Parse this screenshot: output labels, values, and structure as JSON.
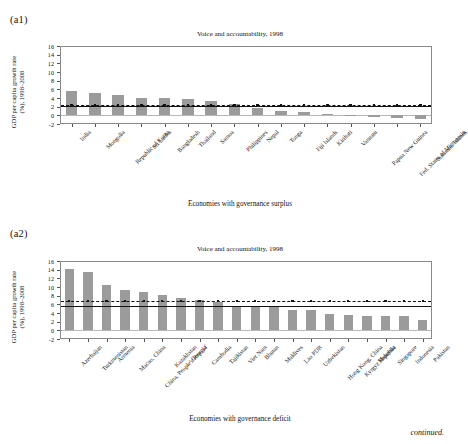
{
  "panels": {
    "a1": {
      "tag": "(a1)",
      "title": "Voice and accountability, 1998",
      "ylabel_line1": "GDP per capita growth rate",
      "ylabel_line2": "(%), 1998–2008",
      "xlabel": "Economies with governance surplus"
    },
    "a2": {
      "tag": "(a2)",
      "title": "Voice and accountability, 1998",
      "ylabel_line1": "GDP per capita growth rate",
      "ylabel_line2": "(%), 1998–2008",
      "xlabel": "Economies with governance deficit"
    }
  },
  "footer": {
    "continued": "continued."
  },
  "chart_data": [
    {
      "id": "a1",
      "type": "bar",
      "title": "Voice and accountability, 1998",
      "xlabel": "Economies with governance surplus",
      "ylabel": "GDP per capita growth rate (%), 1998–2008",
      "ylim": [
        -2,
        16
      ],
      "yticks": [
        -2,
        0,
        2,
        4,
        6,
        8,
        10,
        12,
        14,
        16
      ],
      "ytick_labels": [
        "-2",
        "0",
        "2",
        "4",
        "6",
        "8",
        "10",
        "12",
        "14",
        "16"
      ],
      "grid": false,
      "legend": "none",
      "bar_color": "#9b9b9b",
      "categories": [
        "India",
        "Mongolia",
        "Republic of Korea",
        "Sri Lanka",
        "Bangladesh",
        "Thailand",
        "Samoa",
        "Philippines",
        "Nepal",
        "Tonga",
        "Fiji Islands",
        "Kiribati",
        "Vanuatu",
        "Papua New Guinea",
        "Fed. States of Micronesia",
        "Solomon Islands"
      ],
      "values": [
        5.6,
        5.1,
        4.7,
        4.1,
        4.0,
        3.8,
        3.2,
        2.6,
        1.7,
        1.1,
        0.8,
        0.3,
        0.05,
        -0.3,
        -0.7,
        -0.8
      ],
      "reference_lines": [
        {
          "name": "mean-dashed",
          "value": 2.3,
          "style": "dashed",
          "markers": true,
          "color": "#111111"
        },
        {
          "name": "mean-solid",
          "value": 2.1,
          "style": "solid",
          "markers": false,
          "color": "#111111"
        }
      ]
    },
    {
      "id": "a2",
      "type": "bar",
      "title": "Voice and accountability, 1998",
      "xlabel": "Economies with governance deficit",
      "ylabel": "GDP per capita growth rate (%), 1998–2008",
      "ylim": [
        -2,
        16
      ],
      "yticks": [
        -2,
        0,
        2,
        4,
        6,
        8,
        10,
        12,
        14,
        16
      ],
      "ytick_labels": [
        "-2",
        "0",
        "2",
        "4",
        "6",
        "8",
        "10",
        "12",
        "14",
        "16"
      ],
      "grid": false,
      "legend": "none",
      "bar_color": "#9b9b9b",
      "categories": [
        "Azerbaijan",
        "Turkmenistan",
        "Armenia",
        "Macao, China",
        "China, People's Rep. of",
        "Kazakhstan",
        "Georgia",
        "Cambodia",
        "Tajikistan",
        "Viet Nam",
        "Bhutan",
        "Maldives",
        "Lao PDR",
        "Uzbekistan",
        "Hong Kong, China",
        "Kyrgyz Republic",
        "Malaysia",
        "Singapore",
        "Indonesia",
        "Pakistan"
      ],
      "values": [
        14.2,
        13.5,
        10.4,
        9.3,
        8.9,
        8.2,
        7.4,
        7.1,
        6.6,
        5.7,
        5.7,
        5.5,
        4.7,
        4.6,
        3.8,
        3.5,
        3.3,
        3.2,
        3.2,
        2.4
      ],
      "reference_lines": [
        {
          "name": "mean-dashed",
          "value": 6.7,
          "style": "dashed",
          "markers": true,
          "color": "#111111"
        },
        {
          "name": "mean-solid",
          "value": 5.6,
          "style": "solid",
          "markers": false,
          "color": "#111111"
        }
      ]
    }
  ]
}
